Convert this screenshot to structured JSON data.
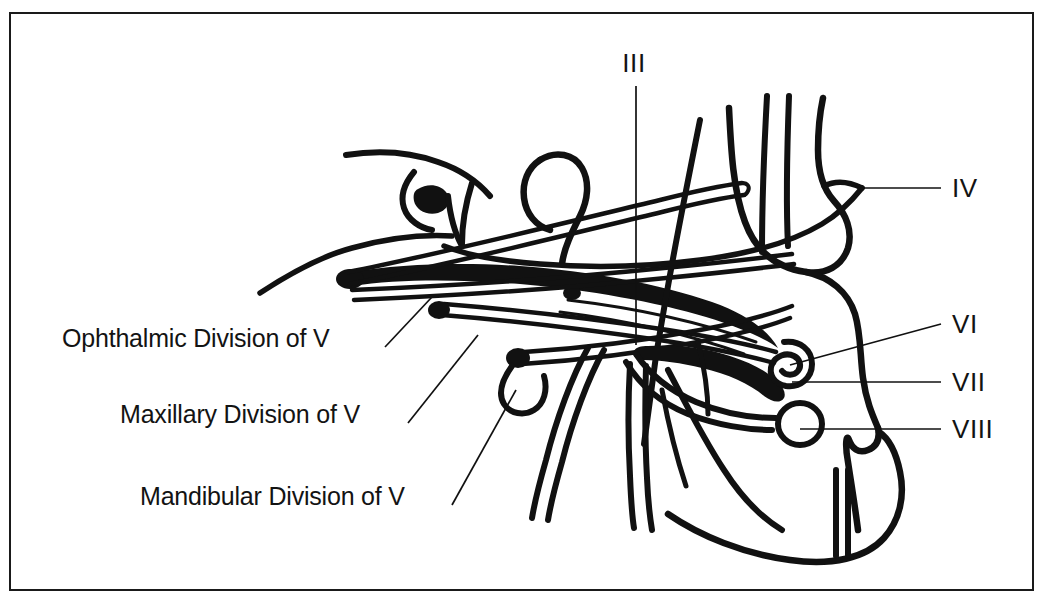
{
  "figure": {
    "background_color": "#ffffff",
    "ink_color": "#111111",
    "frame": {
      "border_color": "#1a1a1a",
      "border_width_px": 2
    }
  },
  "labels": {
    "left": [
      {
        "id": "ophthalmic",
        "text": "Ophthalmic Division of V",
        "x": 62,
        "y": 330,
        "anchor": "start"
      },
      {
        "id": "maxillary",
        "text": "Maxillary Division of V",
        "x": 120,
        "y": 407,
        "anchor": "start"
      },
      {
        "id": "mandibular",
        "text": "Mandibular Division of V",
        "x": 140,
        "y": 489,
        "anchor": "start"
      }
    ],
    "top": [
      {
        "id": "nerve-3",
        "text": "III",
        "x": 634,
        "y": 72,
        "anchor": "middle"
      }
    ],
    "right": [
      {
        "id": "nerve-4",
        "text": "IV",
        "x": 952,
        "y": 195,
        "anchor": "start"
      },
      {
        "id": "nerve-6",
        "text": "VI",
        "x": 952,
        "y": 331,
        "anchor": "start"
      },
      {
        "id": "nerve-7",
        "text": "VII",
        "x": 952,
        "y": 389,
        "anchor": "start"
      },
      {
        "id": "nerve-8",
        "text": "VIII",
        "x": 952,
        "y": 436,
        "anchor": "start"
      }
    ]
  },
  "leaders": [
    {
      "id": "leader-ophthalmic",
      "from": [
        385,
        347
      ],
      "to": [
        432,
        297
      ]
    },
    {
      "id": "leader-maxillary",
      "from": [
        408,
        423
      ],
      "to": [
        478,
        335
      ]
    },
    {
      "id": "leader-mandibular",
      "from": [
        452,
        505
      ],
      "to": [
        516,
        390
      ]
    },
    {
      "id": "leader-iii",
      "from": [
        636,
        86
      ],
      "to": [
        636,
        345
      ]
    },
    {
      "id": "leader-iv",
      "from": [
        941,
        188
      ],
      "to": [
        862,
        188
      ]
    },
    {
      "id": "leader-vi",
      "from": [
        941,
        324
      ],
      "to": [
        790,
        365
      ]
    },
    {
      "id": "leader-vii",
      "from": [
        941,
        382
      ],
      "to": [
        792,
        382
      ]
    },
    {
      "id": "leader-viii",
      "from": [
        941,
        429
      ],
      "to": [
        800,
        429
      ]
    }
  ]
}
